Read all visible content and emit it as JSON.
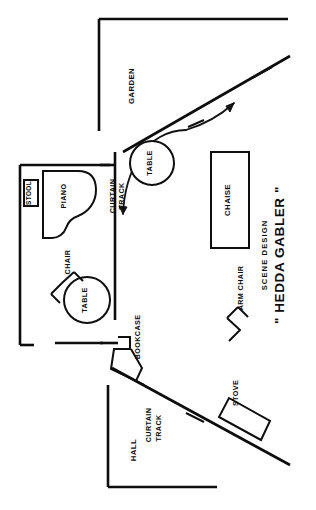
{
  "drawing": {
    "kind": "scene-design-floor-plan",
    "orientation_note": "labels rotated 90 degrees (page read sideways)",
    "title_line_1": "SCENE   DESIGN",
    "title_line_2": "\" HEDDA GABLER \"",
    "background_color": "#ffffff",
    "ink_color": "#0d0d0d"
  },
  "areas": {
    "garden": "GARDEN",
    "hall": "HALL"
  },
  "furniture": {
    "piano": "PIANO",
    "stool": "STOOL",
    "table_upper": "TABLE",
    "table_lower": "TABLE",
    "chair": "CHAIR",
    "chaise": "CHAISE",
    "arm_chair": "ARM CHAIR",
    "bookcase": "BOOKCASE",
    "stove": "STOVE"
  },
  "tracks": [
    {
      "id": "curtain-track-upper",
      "line_1": "CURTAIN",
      "line_2": "TRACK"
    },
    {
      "id": "curtain-track-lower",
      "line_1": "CURTAIN",
      "line_2": "TRACK"
    }
  ]
}
